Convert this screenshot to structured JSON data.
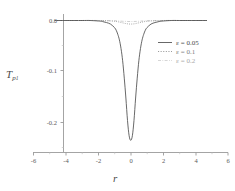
{
  "chart_data": {
    "type": "line",
    "title": "",
    "xlabel": "r",
    "ylabel": "T",
    "ylabel_sub": "p",
    "ylabel_sub2": "1",
    "xlim": [
      -6,
      6
    ],
    "ylim": [
      -0.25,
      0.012
    ],
    "grid": false,
    "legend_position": "right-upper",
    "xticks": [
      -6,
      -4,
      -2,
      0,
      2,
      4,
      6
    ],
    "xticklabels": [
      "-6",
      "-4",
      "-2",
      "0",
      "2",
      "4",
      "6"
    ],
    "yticks": [
      0.0,
      -0.1,
      -0.2
    ],
    "yticklabels": [
      "0.0",
      "-0.1",
      "-0.2"
    ],
    "x_minor_step": 1,
    "y_minor_step": 0.05,
    "data_x_range": [
      -4.7,
      4.7
    ],
    "series": [
      {
        "name": "eps-0.05",
        "legend_label": "ε = 0.05",
        "style": "solid",
        "color": "#4d4d4d",
        "epsilon": 0.05,
        "min_value": -0.235,
        "min_at_x": 0.0,
        "half_width": 0.42,
        "x": [
          -4.7,
          -4.0,
          -3.0,
          -2.5,
          -2.0,
          -1.75,
          -1.5,
          -1.25,
          -1.0,
          -0.9,
          -0.8,
          -0.7,
          -0.6,
          -0.5,
          -0.4,
          -0.3,
          -0.2,
          -0.1,
          0.0,
          0.1,
          0.2,
          0.3,
          0.4,
          0.5,
          0.6,
          0.7,
          0.8,
          0.9,
          1.0,
          1.25,
          1.5,
          1.75,
          2.0,
          2.5,
          3.0,
          4.0,
          4.7
        ],
        "y": [
          0.0,
          0.0,
          0.0,
          0.0,
          -0.001,
          -0.002,
          -0.004,
          -0.007,
          -0.014,
          -0.019,
          -0.027,
          -0.038,
          -0.055,
          -0.079,
          -0.113,
          -0.152,
          -0.196,
          -0.226,
          -0.235,
          -0.226,
          -0.196,
          -0.152,
          -0.113,
          -0.079,
          -0.055,
          -0.038,
          -0.027,
          -0.019,
          -0.014,
          -0.007,
          -0.004,
          -0.002,
          -0.001,
          0.0,
          0.0,
          0.0,
          0.0
        ]
      },
      {
        "name": "eps-0.1",
        "legend_label": "ε = 0.1",
        "style": "dotted",
        "color": "#8a8a8a",
        "epsilon": 0.1,
        "min_value": -0.007,
        "min_at_x": 0.0,
        "half_width": 0.6,
        "x": [
          -4.7,
          -3.0,
          -2.0,
          -1.5,
          -1.0,
          -0.75,
          -0.5,
          -0.25,
          0.0,
          0.25,
          0.5,
          0.75,
          1.0,
          1.5,
          2.0,
          3.0,
          4.7
        ],
        "y": [
          0.0,
          0.0,
          0.0,
          -0.0005,
          -0.0015,
          -0.0028,
          -0.0046,
          -0.0063,
          -0.007,
          -0.0063,
          -0.0046,
          -0.0028,
          -0.0015,
          -0.0005,
          0.0,
          0.0,
          0.0
        ]
      },
      {
        "name": "eps-0.2",
        "legend_label": "ε = 0.2",
        "style": "dashdot",
        "color": "#c2c2c2",
        "epsilon": 0.2,
        "min_value": -0.002,
        "min_at_x": 0.0,
        "half_width": 0.9,
        "x": [
          -4.7,
          -3.0,
          -2.0,
          -1.0,
          -0.5,
          0.0,
          0.5,
          1.0,
          2.0,
          3.0,
          4.7
        ],
        "y": [
          0.0,
          0.0,
          0.0,
          -0.0005,
          -0.0015,
          -0.002,
          -0.0015,
          -0.0005,
          0.0,
          0.0,
          0.0
        ]
      }
    ]
  },
  "legend": {
    "items": [
      {
        "label": "ε = 0.05",
        "style": "solid"
      },
      {
        "label": "ε = 0.1",
        "style": "dotted"
      },
      {
        "label": "ε = 0.2",
        "style": "dashdot"
      }
    ]
  },
  "axes": {
    "x_axis_name": "r",
    "y_axis_name": "T",
    "y_axis_subscript": "p",
    "y_axis_subsubscript": "1"
  }
}
